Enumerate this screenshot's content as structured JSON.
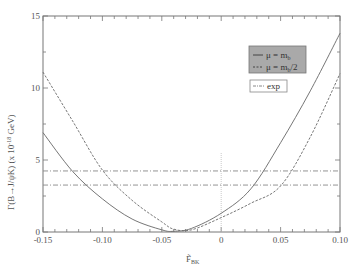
{
  "chart_data": {
    "type": "line",
    "title": "",
    "xlabel": "F̃_BK",
    "ylabel": "Γ(B→J/ψK) (x 10^-18 GeV)",
    "xlim": [
      -0.15,
      0.1
    ],
    "ylim": [
      0,
      15
    ],
    "xticks": [
      -0.15,
      -0.1,
      -0.05,
      0,
      0.05,
      0.1
    ],
    "xtick_labels": [
      "-0.15",
      "-0.10",
      "-0.05",
      "0",
      "0.05",
      "0.10"
    ],
    "yticks": [
      0,
      5,
      10,
      15
    ],
    "ytick_labels": [
      "0",
      "5",
      "10",
      "15"
    ],
    "grid": false,
    "legend_position": "upper right",
    "series": [
      {
        "name": "μ = m_b",
        "style": "solid",
        "x": [
          -0.15,
          -0.125,
          -0.1,
          -0.075,
          -0.05,
          -0.04,
          -0.025,
          0,
          0.025,
          0.05,
          0.075,
          0.1
        ],
        "values": [
          6.9,
          4.2,
          2.3,
          0.9,
          0.15,
          0.05,
          0.25,
          1.3,
          3.0,
          6.2,
          9.8,
          13.8
        ]
      },
      {
        "name": "μ = m_b/2",
        "style": "dashed",
        "x": [
          -0.15,
          -0.125,
          -0.1,
          -0.075,
          -0.05,
          -0.04,
          -0.025,
          0,
          0.025,
          0.05,
          0.075,
          0.1
        ],
        "values": [
          11.1,
          7.7,
          4.3,
          2.2,
          0.7,
          0.2,
          0.15,
          1.0,
          2.0,
          3.2,
          6.6,
          11.0
        ]
      },
      {
        "name": "exp",
        "style": "dash-dot",
        "horizontal_lines": [
          4.24,
          3.26
        ]
      }
    ],
    "annotations": [
      {
        "type": "vertical-dotted-line",
        "x": 0,
        "y_from": 0,
        "y_to": 5.5
      }
    ]
  },
  "legend": {
    "item1": "μ = m",
    "item1_sub": "b",
    "item2": "μ = m",
    "item2_sub": "b",
    "item2_suffix": "/2",
    "item3": "exp"
  },
  "axes": {
    "ylabel_main": "Γ(B→J/ψK) (x 10",
    "ylabel_exp": "-18",
    "ylabel_unit": " GeV)",
    "xlabel_main": "F̃",
    "xlabel_sub": "BK"
  },
  "colors": {
    "axis": "#777777",
    "curve": "#666666",
    "legend_bg": "#a9a9a9"
  }
}
